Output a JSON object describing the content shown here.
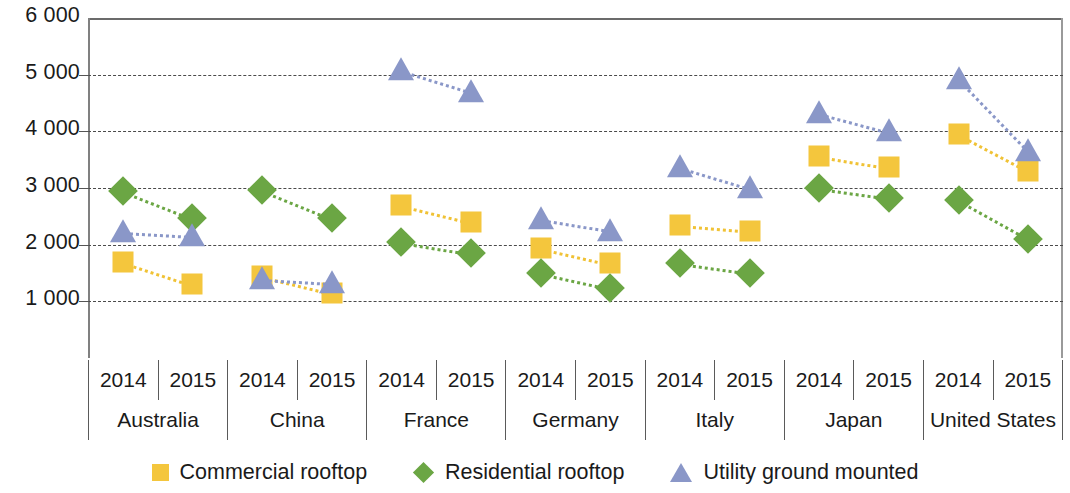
{
  "chart_data": {
    "type": "scatter",
    "title": "",
    "xlabel": "",
    "ylabel": "",
    "ylim": [
      0,
      6000
    ],
    "grid": true,
    "legend_position": "bottom",
    "ytick_labels": [
      "6 000",
      "5 000",
      "4 000",
      "3 000",
      "2 000",
      "1 000"
    ],
    "ytick_values": [
      6000,
      5000,
      4000,
      3000,
      2000,
      1000
    ],
    "countries": [
      "Australia",
      "China",
      "France",
      "Germany",
      "Italy",
      "Japan",
      "United States"
    ],
    "years": [
      "2014",
      "2015"
    ],
    "categories": [
      "Australia 2014",
      "Australia 2015",
      "China 2014",
      "China 2015",
      "France 2014",
      "France 2015",
      "Germany 2014",
      "Germany 2015",
      "Italy 2014",
      "Italy 2015",
      "Japan 2014",
      "Japan 2015",
      "United States 2014",
      "United States 2015"
    ],
    "series": [
      {
        "name": "Commercial rooftop",
        "marker": "square",
        "color": "#F4C63D",
        "values": [
          1700,
          1300,
          1450,
          1150,
          2700,
          2400,
          1950,
          1670,
          2350,
          2250,
          3570,
          3370,
          3950,
          3300
        ]
      },
      {
        "name": "Residential rooftop",
        "marker": "diamond",
        "color": "#6BA644",
        "values": [
          2950,
          2470,
          2970,
          2470,
          2050,
          1850,
          1500,
          1230,
          1670,
          1500,
          3000,
          2830,
          2780,
          2100
        ]
      },
      {
        "name": "Utility ground mounted",
        "marker": "triangle",
        "color": "#8A97C8",
        "values": [
          2220,
          2150,
          1400,
          1330,
          5080,
          4700,
          2450,
          2250,
          3370,
          3000,
          4330,
          4000,
          4920,
          3650
        ]
      }
    ]
  },
  "legend": {
    "items": [
      {
        "label": "Commercial rooftop"
      },
      {
        "label": "Residential rooftop"
      },
      {
        "label": "Utility ground mounted"
      }
    ]
  }
}
